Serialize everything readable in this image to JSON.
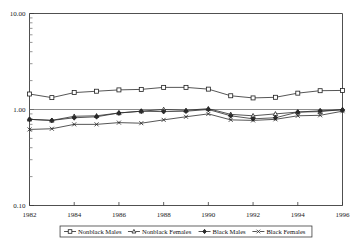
{
  "chart_data": {
    "type": "line",
    "title": "",
    "subtitle": "",
    "xlabel": "",
    "ylabel": "",
    "x": [
      1982,
      1983,
      1984,
      1985,
      1986,
      1987,
      1988,
      1989,
      1990,
      1991,
      1992,
      1993,
      1994,
      1995,
      1996
    ],
    "x_tick_labels": [
      "1982",
      "1984",
      "1986",
      "1988",
      "1990",
      "1992",
      "1994",
      "1996"
    ],
    "x_ticks": [
      1982,
      1984,
      1986,
      1988,
      1990,
      1992,
      1994,
      1996
    ],
    "xlim": [
      1982,
      1996
    ],
    "y_tick_labels": [
      "10.00",
      "1.00",
      "0.10"
    ],
    "y_ticks": [
      10.0,
      1.0,
      0.1
    ],
    "ylim": [
      0.1,
      10.0
    ],
    "yscale": "log",
    "grid": "reference line at 1.00",
    "legend_position": "below-axes",
    "series": [
      {
        "name": "Nonblack Males",
        "marker": "square-open",
        "values": [
          1.45,
          1.33,
          1.5,
          1.55,
          1.6,
          1.62,
          1.7,
          1.7,
          1.63,
          1.39,
          1.32,
          1.34,
          1.48,
          1.57,
          1.58
        ]
      },
      {
        "name": "Nonblack Females",
        "marker": "triangle-open",
        "values": [
          0.79,
          0.77,
          0.85,
          0.86,
          0.92,
          0.96,
          1.0,
          0.98,
          1.02,
          0.89,
          0.86,
          0.9,
          0.94,
          0.95,
          1.0
        ]
      },
      {
        "name": "Black Males",
        "marker": "diamond-solid",
        "values": [
          0.79,
          0.77,
          0.82,
          0.84,
          0.92,
          0.96,
          0.95,
          0.96,
          1.0,
          0.86,
          0.8,
          0.82,
          0.94,
          0.97,
          0.99
        ]
      },
      {
        "name": "Black Females",
        "marker": "x-cross",
        "values": [
          0.62,
          0.63,
          0.7,
          0.7,
          0.73,
          0.72,
          0.78,
          0.84,
          0.9,
          0.78,
          0.77,
          0.79,
          0.86,
          0.87,
          0.96
        ]
      }
    ]
  },
  "legend": {
    "entries": [
      {
        "label": "Nonblack Males",
        "marker": "square-open"
      },
      {
        "label": "Nonblack Females",
        "marker": "triangle-open"
      },
      {
        "label": "Black Males",
        "marker": "diamond-solid"
      },
      {
        "label": "Black Females",
        "marker": "x-cross"
      }
    ]
  },
  "caption": {
    "text": ""
  },
  "colors": {
    "line": "#2b2b2b",
    "frame": "#3c3c3c",
    "grid": "#6e6e6e",
    "background": "#ffffff"
  }
}
